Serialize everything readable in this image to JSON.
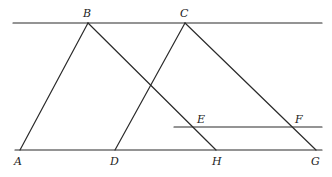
{
  "diagram": {
    "type": "geometry",
    "stroke_color": "#2a2a2a",
    "background": "#ffffff",
    "points": {
      "A": {
        "label": "A",
        "x": 20,
        "y": 150
      },
      "B": {
        "label": "B",
        "x": 88,
        "y": 23
      },
      "C": {
        "label": "C",
        "x": 185,
        "y": 23
      },
      "D": {
        "label": "D",
        "x": 115,
        "y": 150
      },
      "E": {
        "label": "E",
        "x": 195,
        "y": 127
      },
      "F": {
        "label": "F",
        "x": 293,
        "y": 127
      },
      "G": {
        "label": "G",
        "x": 316,
        "y": 150
      },
      "H": {
        "label": "H",
        "x": 216,
        "y": 150
      }
    },
    "lines": [
      {
        "name": "top-line",
        "x1": 13,
        "y1": 23,
        "x2": 322,
        "y2": 23
      },
      {
        "name": "bottom-line",
        "x1": 15,
        "y1": 150,
        "x2": 322,
        "y2": 150
      },
      {
        "name": "line-ef",
        "x1": 174,
        "y1": 127,
        "x2": 322,
        "y2": 127
      },
      {
        "name": "segment-ab",
        "x1": 20,
        "y1": 150,
        "x2": 88,
        "y2": 23
      },
      {
        "name": "segment-bh",
        "x1": 88,
        "y1": 23,
        "x2": 216,
        "y2": 150
      },
      {
        "name": "segment-dc",
        "x1": 115,
        "y1": 150,
        "x2": 185,
        "y2": 23
      },
      {
        "name": "segment-cg",
        "x1": 185,
        "y1": 23,
        "x2": 316,
        "y2": 150
      }
    ],
    "labels": {
      "A": "A",
      "B": "B",
      "C": "C",
      "D": "D",
      "E": "E",
      "F": "F",
      "G": "G",
      "H": "H"
    }
  }
}
